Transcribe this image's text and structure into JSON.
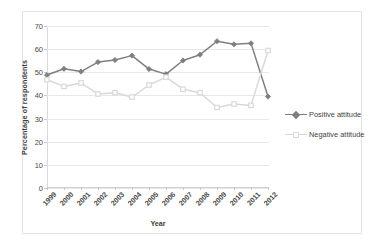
{
  "chart_data": {
    "type": "line",
    "title": "",
    "xlabel": "Year",
    "ylabel": "Percentage of respondents",
    "categories": [
      "1999",
      "2000",
      "2001",
      "2002",
      "2003",
      "2004",
      "2005",
      "2006",
      "2007",
      "2008",
      "2009",
      "2010",
      "2011",
      "2012"
    ],
    "ylim": [
      0,
      70
    ],
    "yticks": [
      0,
      10,
      20,
      30,
      40,
      50,
      60,
      70
    ],
    "grid": true,
    "legend_position": "right",
    "series": [
      {
        "name": "Positive attitude",
        "color": "#7f7f7f",
        "marker": "diamond",
        "values": [
          48.8,
          51.5,
          50.3,
          54.4,
          55.3,
          57.2,
          51.4,
          49.2,
          55.1,
          57.6,
          63.4,
          62.1,
          62.5,
          39.5
        ]
      },
      {
        "name": "Negative attitude",
        "color": "#d9d9d9",
        "marker": "square",
        "values": [
          46.8,
          43.9,
          45.4,
          40.6,
          41.2,
          39.3,
          44.5,
          47.9,
          42.7,
          41.2,
          34.8,
          36.3,
          35.7,
          59.4
        ]
      }
    ]
  },
  "colors": {
    "positive": "#7f7f7f",
    "negative": "#d9d9d9",
    "gridline": "#e8e8e8",
    "frame": "#e3e3e3",
    "tick_text": "#4a4a4a",
    "axis_title": "#3d3d3d",
    "background": "#ffffff"
  },
  "legend": {
    "items": [
      {
        "label": "Positive attitude"
      },
      {
        "label": "Negative attitude"
      }
    ]
  }
}
